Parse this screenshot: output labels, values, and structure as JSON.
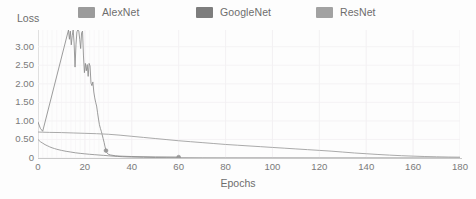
{
  "chart_data": {
    "type": "line",
    "title": "",
    "xlabel": "Epochs",
    "ylabel": "Loss",
    "xlim": [
      0,
      180
    ],
    "ylim": [
      0,
      3.45
    ],
    "grid": true,
    "legend_position": "top",
    "xticks": [
      0,
      20,
      40,
      60,
      80,
      100,
      120,
      140,
      160,
      180
    ],
    "xtick_labels": [
      "0",
      "20",
      "40",
      "60",
      "80",
      "100",
      "120",
      "140",
      "160",
      "180"
    ],
    "yticks": [
      0,
      0.5,
      1.0,
      1.5,
      2.0,
      2.5,
      3.0
    ],
    "ytick_labels": [
      "0",
      "0.50",
      "1.00",
      "1.50",
      "2.00",
      "2.50",
      "3.00"
    ],
    "series": [
      {
        "name": "AlexNet",
        "color": "#9b9b9b",
        "x": [
          0,
          1,
          2,
          3,
          4,
          5,
          6,
          7,
          8,
          9,
          10,
          12,
          14,
          16,
          18,
          20,
          22,
          24,
          26,
          28,
          29,
          30,
          32,
          34,
          36,
          40,
          45,
          50,
          55,
          60,
          70,
          80,
          100,
          120,
          140,
          160,
          180
        ],
        "values": [
          0.5,
          0.44,
          0.4,
          0.36,
          0.33,
          0.3,
          0.275,
          0.255,
          0.235,
          0.22,
          0.205,
          0.18,
          0.16,
          0.14,
          0.125,
          0.112,
          0.1,
          0.09,
          0.08,
          0.07,
          0.066,
          0.06,
          0.05,
          0.042,
          0.035,
          0.025,
          0.018,
          0.013,
          0.01,
          0.008,
          0.005,
          0.004,
          0.003,
          0.002,
          0.002,
          0.001,
          0.001
        ]
      },
      {
        "name": "GoogleNet",
        "color": "#8a8a8a",
        "x": [
          0,
          1,
          2,
          13,
          13.4,
          13.8,
          14.2,
          14.6,
          15,
          15.4,
          15.8,
          16.2,
          16.6,
          17,
          17.4,
          17.8,
          18.2,
          18.6,
          19,
          19.4,
          19.8,
          20.2,
          20.6,
          21,
          21.4,
          21.8,
          22.2,
          22.6,
          23,
          23.4,
          23.8,
          24.2,
          24.6,
          25,
          25.4,
          25.8,
          26.2,
          26.6,
          27,
          27.4,
          27.8,
          28.2,
          28.6,
          29,
          29.4,
          30,
          31,
          33,
          35,
          40,
          50,
          60
        ],
        "values": [
          0.97,
          0.8,
          0.72,
          3.45,
          3.2,
          3.42,
          3.05,
          3.3,
          3.45,
          3.1,
          2.45,
          3.05,
          3.4,
          3.45,
          3.42,
          3.2,
          2.95,
          3.38,
          3.42,
          2.75,
          2.3,
          2.55,
          2.35,
          2.52,
          2.2,
          2.55,
          2.48,
          2.02,
          1.95,
          2.05,
          1.78,
          1.62,
          1.5,
          1.4,
          1.22,
          1.05,
          0.9,
          0.8,
          0.72,
          0.62,
          0.52,
          0.42,
          0.3,
          0.2,
          0.14,
          0.1,
          0.08,
          0.06,
          0.05,
          0.04,
          0.03,
          0.025
        ]
      },
      {
        "name": "ResNet",
        "color": "#a5a5a5",
        "x": [
          0,
          2,
          5,
          10,
          15,
          20,
          25,
          30,
          35,
          40,
          45,
          50,
          55,
          60,
          65,
          70,
          75,
          80,
          85,
          90,
          95,
          100,
          105,
          110,
          115,
          120,
          125,
          130,
          135,
          140,
          145,
          150,
          155,
          160,
          165,
          170,
          175,
          180
        ],
        "values": [
          0.7,
          0.695,
          0.69,
          0.685,
          0.675,
          0.665,
          0.655,
          0.64,
          0.615,
          0.585,
          0.555,
          0.525,
          0.495,
          0.465,
          0.44,
          0.415,
          0.39,
          0.365,
          0.345,
          0.325,
          0.305,
          0.285,
          0.265,
          0.245,
          0.225,
          0.205,
          0.185,
          0.16,
          0.135,
          0.115,
          0.095,
          0.078,
          0.062,
          0.05,
          0.04,
          0.032,
          0.026,
          0.022
        ]
      }
    ],
    "markers": [
      {
        "x": 29,
        "y": 0.2,
        "label": ""
      },
      {
        "x": 60,
        "y": 0.025,
        "label": ""
      }
    ]
  },
  "legend": {
    "items": [
      {
        "label": "AlexNet",
        "color": "#9b9b9b"
      },
      {
        "label": "GoogleNet",
        "color": "#7d7d7d"
      },
      {
        "label": "ResNet",
        "color": "#a2a2a2"
      }
    ]
  },
  "axes": {
    "y_title": "Loss",
    "x_title": "Epochs"
  }
}
